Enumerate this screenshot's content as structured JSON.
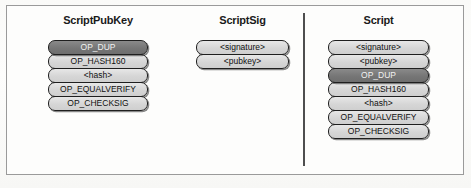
{
  "figure": {
    "background_color": "#fdfdfc",
    "frame_border_color": "#9a9a9a",
    "divider_color": "#4e4e4e"
  },
  "palette": {
    "pill_light": "#d6d6d6",
    "pill_dark": "#767676",
    "pill_border": "#1f1f1f",
    "text_dark": "#111111",
    "text_light": "#f2f2f2"
  },
  "columns": [
    {
      "id": "scriptpubkey",
      "title": "ScriptPubKey",
      "items": [
        {
          "label": "OP_DUP",
          "style": "dark"
        },
        {
          "label": "OP_HASH160",
          "style": "light"
        },
        {
          "label": "<hash>",
          "style": "light"
        },
        {
          "label": "OP_EQUALVERIFY",
          "style": "light"
        },
        {
          "label": "OP_CHECKSIG",
          "style": "light"
        }
      ]
    },
    {
      "id": "scriptsig",
      "title": "ScriptSig",
      "items": [
        {
          "label": "<signature>",
          "style": "light"
        },
        {
          "label": "<pubkey>",
          "style": "light"
        }
      ]
    },
    {
      "id": "script",
      "title": "Script",
      "items": [
        {
          "label": "<signature>",
          "style": "light"
        },
        {
          "label": "<pubkey>",
          "style": "light"
        },
        {
          "label": "OP_DUP",
          "style": "dark"
        },
        {
          "label": "OP_HASH160",
          "style": "light"
        },
        {
          "label": "<hash>",
          "style": "light"
        },
        {
          "label": "OP_EQUALVERIFY",
          "style": "light"
        },
        {
          "label": "OP_CHECKSIG",
          "style": "light"
        }
      ]
    }
  ]
}
